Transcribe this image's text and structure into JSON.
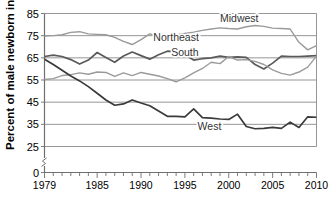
{
  "chart_data": {
    "type": "line",
    "title": "",
    "xlabel": "",
    "ylabel": "Percent of male newborn infants",
    "xlim": [
      1979,
      2010
    ],
    "ylim": [
      25,
      85
    ],
    "axis_break": true,
    "zero_tick": "0",
    "grid": true,
    "legend_position": "inline-annotations",
    "ytick_labels": [
      "85",
      "75",
      "65",
      "55",
      "45",
      "35",
      "25",
      "0"
    ],
    "ytick_values": [
      85,
      75,
      65,
      55,
      45,
      35,
      25,
      0
    ],
    "xtick_labels": [
      "1979",
      "1985",
      "1990",
      "1995",
      "2000",
      "2005",
      "2010"
    ],
    "xtick_values": [
      1979,
      1985,
      1990,
      1995,
      2000,
      2005,
      2010
    ],
    "x": [
      1979,
      1980,
      1981,
      1982,
      1983,
      1984,
      1985,
      1986,
      1987,
      1988,
      1989,
      1990,
      1991,
      1992,
      1993,
      1994,
      1995,
      1996,
      1997,
      1998,
      1999,
      2000,
      2001,
      2002,
      2003,
      2004,
      2005,
      2006,
      2007,
      2008,
      2009,
      2010
    ],
    "series": [
      {
        "name": "Midwest",
        "color": "#9a9a9a",
        "label": "Midwest",
        "label_x": 2001.2,
        "label_y": 81.0,
        "values": [
          74.8,
          75.0,
          75.4,
          76.5,
          76.8,
          75.8,
          75.6,
          75.4,
          74.2,
          72.4,
          71.0,
          73.2,
          75.8,
          74.6,
          74.8,
          75.3,
          76.0,
          76.6,
          77.4,
          78.0,
          78.5,
          78.2,
          78.0,
          79.0,
          79.6,
          79.2,
          78.4,
          78.2,
          78.0,
          72.0,
          68.6,
          70.5
        ]
      },
      {
        "name": "Northeast",
        "color": "#5a5a5a",
        "label": "Northeast",
        "label_x": 1994.0,
        "label_y": 72.5,
        "values": [
          65.6,
          66.2,
          65.6,
          64.2,
          62.2,
          64.0,
          67.4,
          65.2,
          63.0,
          65.8,
          67.6,
          66.0,
          64.4,
          66.4,
          68.0,
          67.8,
          66.4,
          64.0,
          64.6,
          65.0,
          65.8,
          65.2,
          65.4,
          65.2,
          62.0,
          60.0,
          62.6,
          65.8,
          65.6,
          65.6,
          65.8,
          66.0
        ]
      },
      {
        "name": "South",
        "color": "#9a9a9a",
        "label": "South",
        "label_x": 1995.0,
        "label_y": 66.0,
        "values": [
          55.2,
          55.6,
          57.0,
          57.4,
          58.2,
          57.6,
          58.6,
          58.4,
          56.6,
          58.2,
          57.0,
          58.4,
          57.6,
          56.8,
          55.6,
          54.2,
          56.0,
          58.2,
          60.2,
          63.0,
          62.4,
          65.6,
          64.0,
          64.2,
          63.4,
          62.0,
          59.6,
          58.0,
          57.2,
          58.6,
          60.8,
          65.8
        ]
      },
      {
        "name": "West",
        "color": "#3a3a3a",
        "label": "West",
        "label_x": 1997.8,
        "label_y": 32.5,
        "values": [
          64.4,
          62.0,
          59.4,
          56.8,
          54.6,
          52.0,
          49.0,
          46.0,
          43.6,
          44.2,
          46.0,
          44.6,
          43.4,
          41.0,
          38.6,
          38.6,
          38.4,
          42.0,
          38.0,
          37.8,
          37.4,
          37.2,
          39.6,
          34.0,
          33.0,
          33.2,
          33.6,
          33.2,
          36.0,
          33.6,
          38.4,
          38.2
        ]
      }
    ]
  }
}
